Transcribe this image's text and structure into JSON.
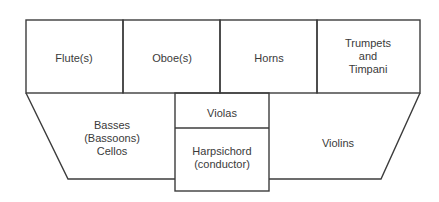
{
  "diagram": {
    "type": "orchestra-seating-plan",
    "line_color": "#3c3c3c",
    "sections": {
      "flutes": {
        "lines": [
          "Flute(s)"
        ]
      },
      "oboes": {
        "lines": [
          "Oboe(s)"
        ]
      },
      "horns": {
        "lines": [
          "Horns"
        ]
      },
      "trumpets": {
        "lines": [
          "Trumpets",
          "and",
          "Timpani"
        ]
      },
      "basses": {
        "lines": [
          "Basses",
          "(Bassoons)",
          "Cellos"
        ]
      },
      "violas": {
        "lines": [
          "Violas"
        ]
      },
      "harpsichord": {
        "lines": [
          "Harpsichord",
          "(conductor)"
        ]
      },
      "violins": {
        "lines": [
          "Violins"
        ]
      }
    }
  }
}
